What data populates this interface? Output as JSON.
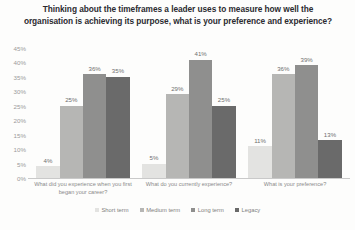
{
  "chart_data": {
    "type": "bar",
    "title": "Thinking about the timeframes a leader uses to measure how well the organisation is achieving its purpose, what is your preference and experience?",
    "xlabel": "",
    "ylabel": "",
    "ylim": [
      0,
      45
    ],
    "grid": false,
    "legend_position": "bottom-center",
    "categories": [
      "What did you experience when you first began your career?",
      "What do you currently experience?",
      "What is your preference?"
    ],
    "y_ticks": [
      "0%",
      "5%",
      "10%",
      "15%",
      "20%",
      "25%",
      "30%",
      "35%",
      "40%",
      "45%"
    ],
    "y_tick_values": [
      0,
      5,
      10,
      15,
      20,
      25,
      30,
      35,
      40,
      45
    ],
    "series": [
      {
        "name": "Short term",
        "color": "#e3e3e1",
        "values": [
          4,
          5,
          11
        ],
        "labels": [
          "4%",
          "5%",
          "11%"
        ]
      },
      {
        "name": "Medium term",
        "color": "#b6b6b4",
        "values": [
          25,
          29,
          36
        ],
        "labels": [
          "25%",
          "29%",
          "36%"
        ]
      },
      {
        "name": "Long term",
        "color": "#8f8f8e",
        "values": [
          36,
          41,
          39
        ],
        "labels": [
          "36%",
          "41%",
          "39%"
        ]
      },
      {
        "name": "Legacy",
        "color": "#6a6a6a",
        "values": [
          35,
          25,
          13
        ],
        "labels": [
          "35%",
          "25%",
          "13%"
        ]
      }
    ]
  }
}
